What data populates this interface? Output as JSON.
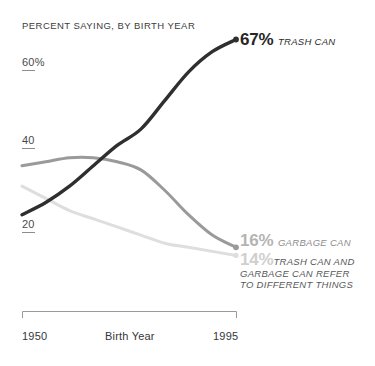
{
  "chart_data": {
    "type": "line",
    "title": "PERCENT SAYING, BY BIRTH YEAR",
    "xlabel": "Birth Year",
    "ylabel": "",
    "xlim": [
      1950,
      1995
    ],
    "ylim": [
      10,
      70
    ],
    "grid": false,
    "legend_position": "inline-right-end-of-line",
    "x_ticks": [
      "1950",
      "1995"
    ],
    "y_ticks": [
      "60%",
      "40",
      "20"
    ],
    "y_tick_values": [
      60,
      40,
      20
    ],
    "x": [
      1950,
      1955,
      1960,
      1965,
      1970,
      1975,
      1980,
      1985,
      1990,
      1995
    ],
    "series": [
      {
        "name": "TRASH CAN",
        "color": "#2f2f2f",
        "end_value": 67,
        "end_label": "67%",
        "values": [
          24,
          27,
          31,
          36,
          41,
          45,
          52,
          59,
          64,
          67
        ]
      },
      {
        "name": "GARBAGE CAN",
        "color": "#9a9a9a",
        "end_value": 16,
        "end_label": "16%",
        "values": [
          36,
          37,
          38,
          38,
          37,
          35,
          30,
          24,
          19,
          16
        ]
      },
      {
        "name": "TRASH CAN AND GARBAGE CAN REFER TO DIFFERENT THINGS",
        "color": "#dedede",
        "end_value": 14,
        "end_label": "14%",
        "values": [
          31,
          28,
          25,
          23,
          21,
          19,
          17,
          16,
          15,
          14
        ]
      }
    ]
  },
  "header": {
    "title": "PERCENT SAYING, BY BIRTH YEAR"
  },
  "yaxis": {
    "ticks": [
      {
        "label": "60%"
      },
      {
        "label": "40"
      },
      {
        "label": "20"
      }
    ]
  },
  "xaxis": {
    "start": "1950",
    "end": "1995",
    "label": "Birth Year"
  },
  "labels": {
    "trash": {
      "percent": "67%",
      "caption": "TRASH CAN"
    },
    "garbage": {
      "percent": "16%",
      "caption": "GARBAGE CAN"
    },
    "both": {
      "percent": "14%",
      "caption_line1": "TRASH CAN AND",
      "caption_line2": "GARBAGE CAN REFER",
      "caption_line3": "TO DIFFERENT THINGS"
    }
  },
  "colors": {
    "trash_line": "#2f2f2f",
    "garbage_line": "#9a9a9a",
    "both_line": "#dedede",
    "axis": "#9a9a9a",
    "text": "#33373a"
  }
}
